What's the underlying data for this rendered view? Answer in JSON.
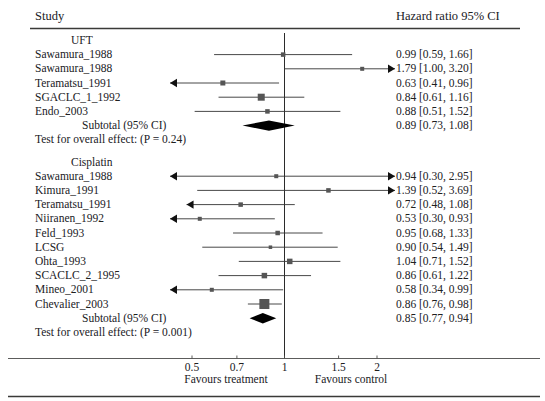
{
  "header": {
    "study_label": "Study",
    "ci_label": "Hazard ratio 95% CI"
  },
  "axis": {
    "ticks": [
      "0.5",
      "0.7",
      "1",
      "1.5",
      "2"
    ],
    "tick_values": [
      0.5,
      0.7,
      1,
      1.5,
      2
    ],
    "scale": "log",
    "favours_left": "Favours treatment",
    "favours_right": "Favours control",
    "reference_line": 1
  },
  "groups": [
    {
      "name": "UFT",
      "subtotal_label": "Subtotal (95% CI)",
      "test_label": "Test for overall effect: (P = 0.24)",
      "subtotal": {
        "estimate": 0.89,
        "low": 0.73,
        "high": 1.08,
        "ci_text": "0.89 [0.73, 1.08]"
      },
      "studies": [
        {
          "name": "Sawamura_1988",
          "estimate": 0.99,
          "low": 0.59,
          "high": 1.66,
          "ci_text": "0.99 [0.59, 1.66]",
          "marker": 4.5,
          "arrow_left": false,
          "arrow_right": false
        },
        {
          "name": "Sawamura_1988",
          "estimate": 1.79,
          "low": 1.0,
          "high": 3.2,
          "ci_text": "1.79 [1.00, 3.20]",
          "marker": 4.0,
          "arrow_left": false,
          "arrow_right": true
        },
        {
          "name": "Teramatsu_1991",
          "estimate": 0.63,
          "low": 0.41,
          "high": 0.96,
          "ci_text": "0.63 [0.41, 0.96]",
          "marker": 5.0,
          "arrow_left": true,
          "arrow_right": false
        },
        {
          "name": "SGACLC_1_1992",
          "estimate": 0.84,
          "low": 0.61,
          "high": 1.16,
          "ci_text": "0.84 [0.61, 1.16]",
          "marker": 7.0,
          "arrow_left": false,
          "arrow_right": false
        },
        {
          "name": "Endo_2003",
          "estimate": 0.88,
          "low": 0.51,
          "high": 1.52,
          "ci_text": "0.88 [0.51, 1.52]",
          "marker": 4.5,
          "arrow_left": false,
          "arrow_right": false
        }
      ]
    },
    {
      "name": "Cisplatin",
      "subtotal_label": "Subtotal (95% CI)",
      "test_label": "Test for overall effect: (P = 0.001)",
      "subtotal": {
        "estimate": 0.85,
        "low": 0.77,
        "high": 0.94,
        "ci_text": "0.85 [0.77, 0.94]"
      },
      "studies": [
        {
          "name": "Sawamura_1988",
          "estimate": 0.94,
          "low": 0.3,
          "high": 2.95,
          "ci_text": "0.94 [0.30, 2.95]",
          "marker": 4.0,
          "arrow_left": true,
          "arrow_right": true
        },
        {
          "name": "Kimura_1991",
          "estimate": 1.39,
          "low": 0.52,
          "high": 3.69,
          "ci_text": "1.39 [0.52, 3.69]",
          "marker": 4.5,
          "arrow_left": false,
          "arrow_right": true
        },
        {
          "name": "Teramatsu_1991",
          "estimate": 0.72,
          "low": 0.48,
          "high": 1.08,
          "ci_text": "0.72 [0.48, 1.08]",
          "marker": 4.5,
          "arrow_left": true,
          "arrow_right": false
        },
        {
          "name": "Niiranen_1992",
          "estimate": 0.53,
          "low": 0.3,
          "high": 0.93,
          "ci_text": "0.53 [0.30, 0.93]",
          "marker": 4.0,
          "arrow_left": true,
          "arrow_right": false
        },
        {
          "name": "Feld_1993",
          "estimate": 0.95,
          "low": 0.68,
          "high": 1.33,
          "ci_text": "0.95 [0.68, 1.33]",
          "marker": 4.5,
          "arrow_left": false,
          "arrow_right": false
        },
        {
          "name": "LCSG",
          "estimate": 0.9,
          "low": 0.54,
          "high": 1.49,
          "ci_text": "0.90 [0.54, 1.49]",
          "marker": 3.5,
          "arrow_left": false,
          "arrow_right": false
        },
        {
          "name": "Ohta_1993",
          "estimate": 1.04,
          "low": 0.71,
          "high": 1.52,
          "ci_text": "1.04 [0.71, 1.52]",
          "marker": 5.5,
          "arrow_left": false,
          "arrow_right": false
        },
        {
          "name": "SCACLC_2_1995",
          "estimate": 0.86,
          "low": 0.61,
          "high": 1.22,
          "ci_text": "0.86 [0.61, 1.22]",
          "marker": 5.5,
          "arrow_left": false,
          "arrow_right": false
        },
        {
          "name": "Mineo_2001",
          "estimate": 0.58,
          "low": 0.34,
          "high": 0.99,
          "ci_text": "0.58 [0.34, 0.99]",
          "marker": 4.0,
          "arrow_left": true,
          "arrow_right": false
        },
        {
          "name": "Chevalier_2003",
          "estimate": 0.86,
          "low": 0.76,
          "high": 0.98,
          "ci_text": "0.86 [0.76, 0.98]",
          "marker": 10.0,
          "arrow_left": false,
          "arrow_right": false
        }
      ]
    }
  ],
  "chart_data": {
    "type": "scatter",
    "title": "",
    "xlabel": "Hazard ratio",
    "ylabel": "Study",
    "scale": "log",
    "xlim": [
      0.42,
      2.6
    ],
    "categories": [
      "UFT: Sawamura_1988",
      "UFT: Sawamura_1988",
      "UFT: Teramatsu_1991",
      "UFT: SGACLC_1_1992",
      "UFT: Endo_2003",
      "UFT: Subtotal (95% CI)",
      "Cisplatin: Sawamura_1988",
      "Cisplatin: Kimura_1991",
      "Cisplatin: Teramatsu_1991",
      "Cisplatin: Niiranen_1992",
      "Cisplatin: Feld_1993",
      "Cisplatin: LCSG",
      "Cisplatin: Ohta_1993",
      "Cisplatin: SCACLC_2_1995",
      "Cisplatin: Mineo_2001",
      "Cisplatin: Chevalier_2003",
      "Cisplatin: Subtotal (95% CI)"
    ],
    "values": [
      0.99,
      1.79,
      0.63,
      0.84,
      0.88,
      0.89,
      0.94,
      1.39,
      0.72,
      0.53,
      0.95,
      0.9,
      1.04,
      0.86,
      0.58,
      0.86,
      0.85
    ],
    "ci_low": [
      0.59,
      1.0,
      0.41,
      0.61,
      0.51,
      0.73,
      0.3,
      0.52,
      0.48,
      0.3,
      0.68,
      0.54,
      0.71,
      0.61,
      0.34,
      0.76,
      0.77
    ],
    "ci_high": [
      1.66,
      3.2,
      0.96,
      1.16,
      1.52,
      1.08,
      2.95,
      3.69,
      1.08,
      0.93,
      1.33,
      1.49,
      1.52,
      1.22,
      0.99,
      0.98,
      0.94
    ],
    "xticks": [
      0.5,
      0.7,
      1,
      1.5,
      2
    ],
    "reference_line": 1,
    "grid": false,
    "legend": []
  },
  "colors": {
    "marker": "#555555",
    "line": "#333333",
    "diamond": "#000000",
    "rule": "#3a3a38",
    "text": "#20201e"
  }
}
